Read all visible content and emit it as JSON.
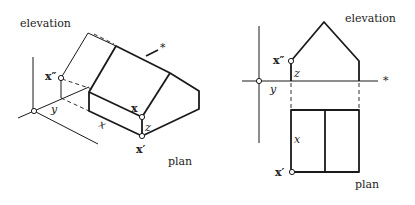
{
  "left_figure": {
    "caption": "oblique projection of house",
    "labels": {
      "elevation": "elevation",
      "plan": "plan",
      "point_x": "x",
      "point_x_double_prime": "x″",
      "point_x_prime": "x′",
      "axis_y": "y",
      "axis_x": "x",
      "axis_z": "z",
      "ridge_marker": "*"
    }
  },
  "right_figure": {
    "caption": "orthographic plan and elevation",
    "labels": {
      "elevation": "elevation",
      "plan": "plan",
      "point_x_double_prime": "x″",
      "point_x_prime": "x′",
      "axis_y": "y",
      "axis_x": "x",
      "axis_z": "z",
      "axis_marker": "*"
    }
  }
}
